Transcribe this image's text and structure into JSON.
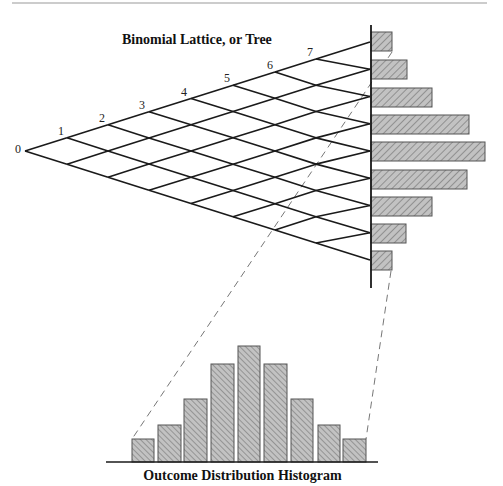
{
  "lattice": {
    "title": "Binomial Lattice, or Tree",
    "steps": 8,
    "step_labels": [
      "0",
      "1",
      "2",
      "3",
      "4",
      "5",
      "6",
      "7"
    ],
    "node_x": [
      25,
      67,
      108,
      149,
      191,
      233,
      275,
      316,
      370
    ],
    "apex_y": 151,
    "slope": 0.316,
    "label_positions": [
      [
        18,
        149
      ],
      [
        61,
        131
      ],
      [
        102,
        118
      ],
      [
        142,
        105
      ],
      [
        184,
        92
      ],
      [
        227,
        78
      ],
      [
        270,
        65
      ],
      [
        310,
        52
      ]
    ]
  },
  "side_histogram": {
    "axis_x": 371,
    "axis_top": 25,
    "axis_bottom": 288,
    "bar_height": 19,
    "bars": [
      {
        "y": 32,
        "right": 392
      },
      {
        "y": 60,
        "right": 407
      },
      {
        "y": 88,
        "right": 432
      },
      {
        "y": 115,
        "right": 469
      },
      {
        "y": 142,
        "right": 485
      },
      {
        "y": 170,
        "right": 467
      },
      {
        "y": 197,
        "right": 432
      },
      {
        "y": 224,
        "right": 406
      },
      {
        "y": 251,
        "right": 392
      }
    ]
  },
  "histogram": {
    "title": "Outcome Distribution Histogram",
    "baseline_y": 462,
    "baseline_x": [
      106,
      378
    ],
    "bars": [
      {
        "x": 132,
        "w": 22,
        "top": 439
      },
      {
        "x": 158,
        "w": 23,
        "top": 425
      },
      {
        "x": 184,
        "w": 23,
        "top": 399
      },
      {
        "x": 211,
        "w": 23,
        "top": 364
      },
      {
        "x": 238,
        "w": 22,
        "top": 346
      },
      {
        "x": 264,
        "w": 23,
        "top": 364
      },
      {
        "x": 291,
        "w": 22,
        "top": 399
      },
      {
        "x": 318,
        "w": 22,
        "top": 425
      },
      {
        "x": 343,
        "w": 23,
        "top": 439
      }
    ]
  },
  "dashed_links": [
    {
      "from": [
        392,
        52
      ],
      "to": [
        132,
        439
      ]
    },
    {
      "from": [
        391,
        271
      ],
      "to": [
        366,
        439
      ]
    }
  ],
  "top_rule": {
    "y": 3,
    "x1": 12,
    "x2": 487
  },
  "colors": {
    "line": "#1a1a1a",
    "bar_fill": "#c2c2c2",
    "hatch": "#6e6e6e",
    "bar_border": "#555555",
    "rule": "#9a9a9a",
    "dash": "#777777"
  }
}
